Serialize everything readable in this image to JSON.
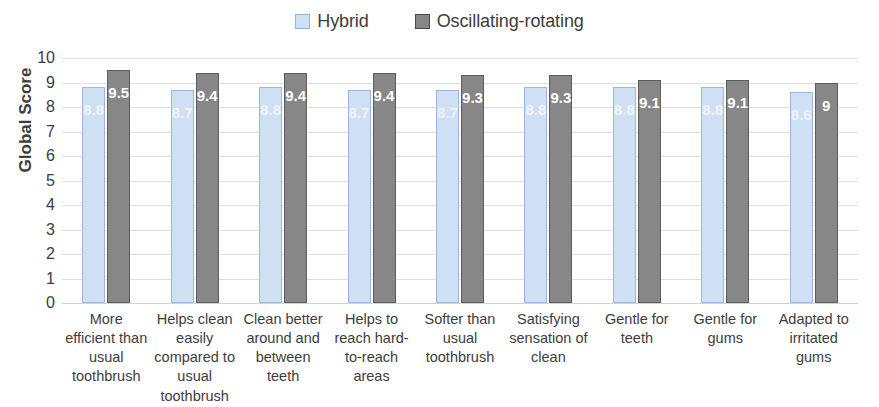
{
  "chart_data": {
    "type": "bar",
    "title": "",
    "xlabel": "",
    "ylabel": "Global Score",
    "ylim": [
      0,
      10
    ],
    "ytick_labels": [
      "10",
      "9",
      "8",
      "7",
      "6",
      "5",
      "4",
      "3",
      "2",
      "1",
      "0"
    ],
    "grid": true,
    "legend_position": "top-center",
    "categories": [
      "More efficient than usual toothbrush",
      "Helps clean easily compared to usual toothbrush",
      "Clean better around and between teeth",
      "Helps to reach hard-to-reach areas",
      "Softer than usual toothbrush",
      "Satisfying sensation of clean",
      "Gentle for teeth",
      "Gentle for gums",
      "Adapted to irritated gums"
    ],
    "series": [
      {
        "name": "Hybrid",
        "color": "#cfe0f4",
        "border_color": "#9ab8dd",
        "values": [
          8.8,
          8.7,
          8.8,
          8.7,
          8.7,
          8.8,
          8.8,
          8.8,
          8.6
        ],
        "labels": [
          "8.8",
          "8.7",
          "8.8",
          "8.7",
          "8.7",
          "8.8",
          "8.8",
          "8.8",
          "8.6"
        ]
      },
      {
        "name": "Oscillating-rotating",
        "color": "#878787",
        "border_color": "#5d5d5d",
        "values": [
          9.5,
          9.4,
          9.4,
          9.4,
          9.3,
          9.3,
          9.1,
          9.1,
          9.0
        ],
        "labels": [
          "9.5",
          "9.4",
          "9.4",
          "9.4",
          "9.3",
          "9.3",
          "9.1",
          "9.1",
          "9"
        ]
      }
    ]
  }
}
